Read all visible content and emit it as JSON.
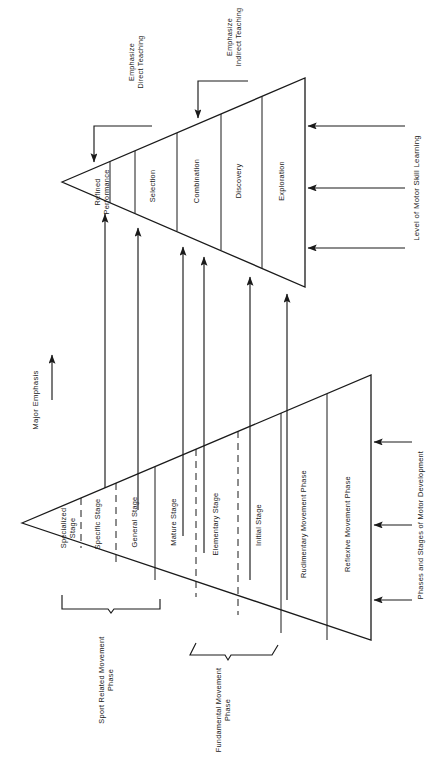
{
  "figure": {
    "orientation": "rotated-90-ccw",
    "ink_color": "#1a1a1a",
    "background_color": "#ffffff"
  },
  "left_axis": {
    "label": "Major Emphasis",
    "arrow": "arrow-right"
  },
  "upper_triangle": {
    "axis_label": "Level of Motor Skill Learning",
    "bands": [
      {
        "label_line1": "Refined",
        "label_line2": "Performance"
      },
      {
        "label_line1": "Selection",
        "label_line2": ""
      },
      {
        "label_line1": "Combination",
        "label_line2": ""
      },
      {
        "label_line1": "Discovery",
        "label_line2": ""
      },
      {
        "label_line1": "Exploration",
        "label_line2": ""
      }
    ],
    "callouts": [
      {
        "line1": "Emphasize",
        "line2": "Direct Teaching"
      },
      {
        "line1": "Emphasize",
        "line2": "Indirect Teaching"
      }
    ],
    "axis_arrow_count": 3
  },
  "lower_triangle": {
    "axis_label": "Phases and Stages of Motor Development",
    "bands": [
      {
        "label_line1": "Specialized",
        "label_line2": "Stage"
      },
      {
        "label_line1": "Specific Stage",
        "label_line2": ""
      },
      {
        "label_line1": "General Stage",
        "label_line2": ""
      },
      {
        "label_line1": "Mature Stage",
        "label_line2": ""
      },
      {
        "label_line1": "Elementary Stage",
        "label_line2": ""
      },
      {
        "label_line1": "Initial Stage",
        "label_line2": ""
      },
      {
        "label_line1": "Rudimentary Movement Phase",
        "label_line2": ""
      },
      {
        "label_line1": "Reflexive Movement Phase",
        "label_line2": ""
      }
    ],
    "braces": [
      {
        "line1": "Sport Related Movement",
        "line2": "Phase"
      },
      {
        "line1": "Fundamental Movement",
        "line2": "Phase"
      }
    ],
    "axis_arrow_count": 3,
    "connector_arrow_count": 6
  }
}
